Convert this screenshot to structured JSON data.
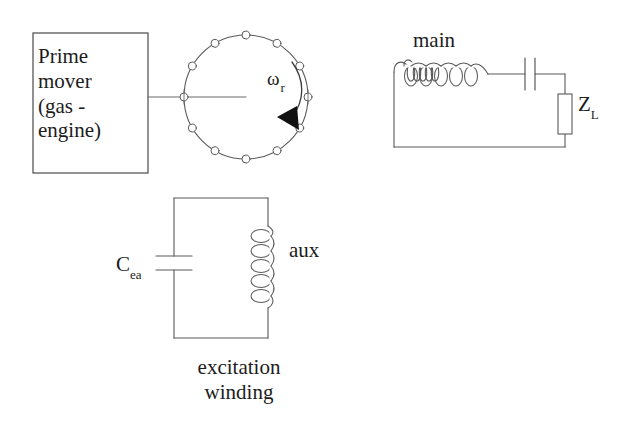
{
  "figure": {
    "type": "electrical-schematic",
    "title_visible": false,
    "background_color": "#ffffff",
    "line_color": "#5a5a5a",
    "text_color": "#1c1c1c"
  },
  "prime_mover": {
    "name": "prime-mover-block",
    "lines": [
      "Prime",
      "mover",
      "(gas -",
      "engine)"
    ],
    "text": "Prime\nmover\n(gas -\nengine)",
    "box": {
      "x": 33,
      "y": 33,
      "width": 115,
      "height": 140
    }
  },
  "generator": {
    "name": "generator-rotor",
    "circle": {
      "cx": 246,
      "cy": 97,
      "r": 62
    },
    "marker_count": 12,
    "marker_radius": 4,
    "shaft": {
      "x1": 148,
      "y1": 97,
      "x2": 246,
      "y2": 97
    },
    "speed_label": {
      "symbol": "ω",
      "subscript": "r",
      "text": "ωr"
    },
    "rotation_arrow": {
      "direction": "clockwise",
      "description": "curved-arrow-clockwise"
    }
  },
  "main_circuit": {
    "name": "main-winding-circuit",
    "label": "main",
    "coil": {
      "name": "main-coil",
      "turns": 5,
      "orientation": "horizontal"
    },
    "capacitor": {
      "name": "main-series-capacitor",
      "orientation": "vertical-plates",
      "label": ""
    },
    "load": {
      "name": "load-impedance",
      "symbol": "Z",
      "subscript": "L",
      "text": "ZL"
    },
    "loop": {
      "left": 394,
      "top": 68,
      "right": 565,
      "bottom": 147
    }
  },
  "excitation_circuit": {
    "name": "excitation-winding-circuit",
    "caption_lines": [
      "excitation",
      "winding"
    ],
    "caption": "excitation\nwinding",
    "capacitor": {
      "name": "excitation-capacitor",
      "symbol": "C",
      "subscript": "ea",
      "text": "Cea",
      "orientation": "horizontal-plates"
    },
    "coil": {
      "name": "aux-coil",
      "label": "aux",
      "turns": 5,
      "orientation": "vertical"
    },
    "loop": {
      "left": 174,
      "top": 198,
      "right": 268,
      "bottom": 338
    }
  }
}
